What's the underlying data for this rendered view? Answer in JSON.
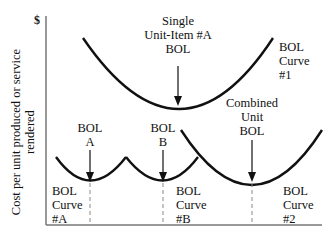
{
  "axis": {
    "y_unit": "$",
    "y_label_line1": "Cost per unit produced or service",
    "y_label_line2": "rendered"
  },
  "labels": {
    "single_unit_item": [
      "Single",
      "Unit-Item #A",
      "BOL"
    ],
    "bol_curve_1": [
      "BOL",
      "Curve",
      "#1"
    ],
    "combined_unit_bol": [
      "Combined",
      "Unit",
      "BOL"
    ],
    "bol_a": [
      "BOL",
      "A"
    ],
    "bol_b": [
      "BOL",
      "B"
    ],
    "bol_curve_a": [
      "BOL",
      "Curve",
      "#A"
    ],
    "bol_curve_b": [
      "BOL",
      "Curve",
      "#B"
    ],
    "bol_curve_2": [
      "BOL",
      "Curve",
      "#2"
    ]
  },
  "colors": {
    "curve": "#111111",
    "axis": "#777777",
    "dashed": "#888888"
  }
}
